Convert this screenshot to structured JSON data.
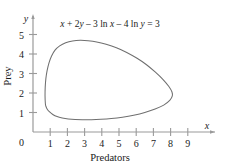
{
  "figure": {
    "annotation": {
      "equation": "x + 2y – 3 ln x – 4 ln y = 3",
      "parts": {
        "p1": "x",
        "p2": " + 2",
        "p3": "y",
        "p4": " – 3 ln ",
        "p5": "x",
        "p6": " – 4 ln ",
        "p7": "y",
        "p8": " = 3"
      }
    },
    "colors": {
      "background": "#ffffff",
      "axis": "#9a9a9a",
      "curve": "#6f6f6f",
      "text": "#1a1a1a"
    }
  },
  "chart_data": {
    "type": "line",
    "title": "x + 2y – 3 ln x – 4 ln y = 3",
    "xlabel": "Predators",
    "ylabel": "Prey",
    "x_axis_symbol": "x",
    "y_axis_symbol": "y",
    "origin_label": "0",
    "xlim": [
      0,
      9.6
    ],
    "ylim": [
      0,
      5.8
    ],
    "grid": false,
    "legend": null,
    "xticks": [
      1,
      2,
      3,
      4,
      5,
      6,
      7,
      8,
      9
    ],
    "xtick_labels": [
      "1",
      "2",
      "3",
      "4",
      "5",
      "6",
      "7",
      "8",
      "9"
    ],
    "yticks": [
      1,
      2,
      3,
      4,
      5
    ],
    "ytick_labels": [
      "1",
      "2",
      "3",
      "4",
      "5"
    ],
    "annotations": [
      {
        "text": "x + 2y – 3 ln x – 4 ln y = 3",
        "x": 4.3,
        "y": 5.3
      }
    ],
    "series": [
      {
        "name": "closed orbit",
        "closed": true,
        "x": [
          0.72,
          0.7,
          0.71,
          0.75,
          0.82,
          0.93,
          1.08,
          1.28,
          1.55,
          1.9,
          2.3,
          2.75,
          3.2,
          3.7,
          4.25,
          4.85,
          5.45,
          6.05,
          6.6,
          7.1,
          7.55,
          7.9,
          8.08,
          8.1,
          7.95,
          7.6,
          7.1,
          6.5,
          5.85,
          5.2,
          4.55,
          3.95,
          3.4,
          2.9,
          2.45,
          2.05,
          1.7,
          1.4,
          1.15,
          0.95,
          0.82,
          0.75,
          0.72
        ],
        "y": [
          1.45,
          1.85,
          2.3,
          2.75,
          3.15,
          3.55,
          3.9,
          4.2,
          4.42,
          4.58,
          4.67,
          4.7,
          4.68,
          4.62,
          4.5,
          4.32,
          4.08,
          3.78,
          3.45,
          3.08,
          2.7,
          2.33,
          2.05,
          1.85,
          1.62,
          1.38,
          1.18,
          1.0,
          0.86,
          0.76,
          0.69,
          0.65,
          0.63,
          0.63,
          0.64,
          0.67,
          0.72,
          0.79,
          0.9,
          1.04,
          1.18,
          1.32,
          1.45
        ]
      }
    ],
    "axes_pixel_mapping": {
      "origin_px": [
        33,
        132
      ],
      "x_unit_px": 17.2,
      "y_unit_px": 19.5
    }
  }
}
